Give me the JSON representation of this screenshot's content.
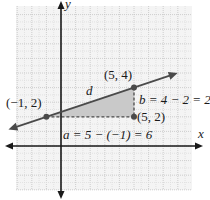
{
  "diagram": {
    "grid": {
      "x_range": [
        -3,
        9
      ],
      "y_range": [
        -3,
        9
      ],
      "unit": 1
    },
    "axes": {
      "x_label": "x",
      "y_label": "y"
    },
    "colors": {
      "axis": "#1a1a1a",
      "line": "#4a4a4a",
      "grid": "#c8c8c8",
      "grid_bg": "#f4f4f4",
      "triangle_fill": "#c9c9c9",
      "point": "#4a4a4a"
    },
    "points": [
      {
        "id": "p1",
        "x": -1,
        "y": 2,
        "label": "(−1, 2)"
      },
      {
        "id": "p2",
        "x": 5,
        "y": 4,
        "label": "(5, 4)"
      },
      {
        "id": "p3",
        "x": 5,
        "y": 2,
        "label": "(5, 2)"
      }
    ],
    "line_label": "d",
    "horizontal_leg_label": "a = 5 − (−1) = 6",
    "vertical_leg_label": "b = 4 − 2 = 2"
  }
}
